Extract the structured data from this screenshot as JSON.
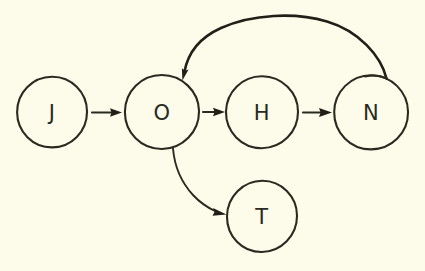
{
  "figure": {
    "kind": "hand-drawn-state-diagram",
    "background_color": "#fdfcea",
    "ink_color": "#2a2a20",
    "width": 425,
    "height": 271
  },
  "nodes": [
    {
      "id": "J",
      "label": "J",
      "cx": 52,
      "cy": 112,
      "r": 35
    },
    {
      "id": "O",
      "label": "O",
      "cx": 162,
      "cy": 112,
      "r": 37
    },
    {
      "id": "H",
      "label": "H",
      "cx": 262,
      "cy": 112,
      "r": 36
    },
    {
      "id": "N",
      "label": "N",
      "cx": 371,
      "cy": 112,
      "r": 37
    },
    {
      "id": "T",
      "label": "T",
      "cx": 262,
      "cy": 216,
      "r": 35
    }
  ],
  "edges": [
    {
      "id": "j-to-o",
      "from": "J",
      "to": "O",
      "style": "straight",
      "direction": "right"
    },
    {
      "id": "o-to-h",
      "from": "O",
      "to": "H",
      "style": "straight",
      "direction": "right"
    },
    {
      "id": "h-to-n",
      "from": "H",
      "to": "N",
      "style": "straight",
      "direction": "right"
    },
    {
      "id": "n-to-o",
      "from": "N",
      "to": "O",
      "style": "curved-arc-over-top",
      "direction": "left"
    },
    {
      "id": "o-to-t",
      "from": "O",
      "to": "T",
      "style": "curved-arc-below",
      "direction": "down-right"
    }
  ]
}
